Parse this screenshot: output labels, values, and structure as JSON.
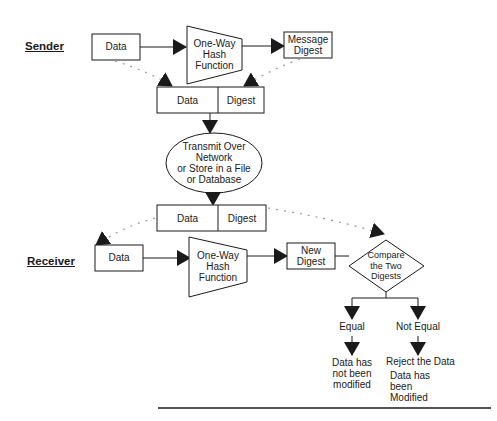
{
  "diagram": {
    "type": "flowchart",
    "sender": {
      "label": "Sender",
      "data_box": "Data",
      "hash_function": "One-Way\nHash\nFunction",
      "digest_box": "Message\nDigest",
      "combined": {
        "left": "Data",
        "right": "Digest"
      }
    },
    "transport": {
      "label": "Transmit Over\nNetwork\nor Store in a File\nor Database"
    },
    "received_combined": {
      "left": "Data",
      "right": "Digest"
    },
    "receiver": {
      "label": "Receiver",
      "data_box": "Data",
      "hash_function": "One-Way\nHash\nFunction",
      "digest_box": "New\nDigest",
      "decision": "Compare\nthe Two\nDigests"
    },
    "outcomes": [
      {
        "branch": "Equal",
        "result": "Data has\nnot been\nmodified"
      },
      {
        "branch": "Not Equal",
        "result": "Reject the Data",
        "detail": "Data has been\nModified"
      }
    ],
    "colors": {
      "stroke": "#1a1a1a",
      "dotted": "#9a9a9a",
      "background": "#ffffff"
    }
  }
}
